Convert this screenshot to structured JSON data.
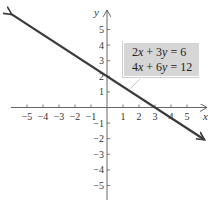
{
  "chart_data": {
    "type": "line",
    "title": "",
    "xlabel": "x",
    "ylabel": "y",
    "xlim": [
      -6,
      6
    ],
    "ylim": [
      -6,
      6
    ],
    "x_ticks": [
      -5,
      -4,
      -3,
      -2,
      -1,
      1,
      2,
      3,
      4,
      5
    ],
    "y_ticks": [
      -5,
      -4,
      -3,
      -2,
      -1,
      1,
      2,
      3,
      4,
      5
    ],
    "x_tick_labels": [
      "−5",
      "−4",
      "−3",
      "−2",
      "−1",
      "1",
      "2",
      "3",
      "4",
      "5"
    ],
    "y_tick_labels": [
      "−5",
      "−4",
      "−3",
      "−2",
      "−1",
      "1",
      "2",
      "3",
      "4",
      "5"
    ],
    "grid": false,
    "series": [
      {
        "name": "2x + 3y = 6 / 4x + 6y = 12",
        "equation": "y = -2/3 x + 2",
        "x": [
          -6,
          -3,
          0,
          3,
          6
        ],
        "y": [
          6,
          4,
          2,
          0,
          -2
        ],
        "arrows_both_ends": true,
        "color": "#3a3a3a"
      }
    ],
    "annotations": [
      {
        "text": "2x + 3y = 6",
        "position": "upper right box"
      },
      {
        "text": "4x + 6y = 12",
        "position": "upper right box"
      }
    ],
    "intercepts": {
      "x_intercept": 3,
      "y_intercept": 2
    }
  },
  "labels": {
    "x_axis": "x",
    "y_axis": "y",
    "eq1": {
      "a": "2",
      "v1": "x",
      "op": " + 3",
      "v2": "y",
      "rhs": " = 6"
    },
    "eq2": {
      "a": "4",
      "v1": "x",
      "op": " + 6",
      "v2": "y",
      "rhs": " = 12"
    }
  },
  "colors": {
    "line": "#3a3a3a",
    "axis": "#555555",
    "box": "#d6d6d6"
  }
}
